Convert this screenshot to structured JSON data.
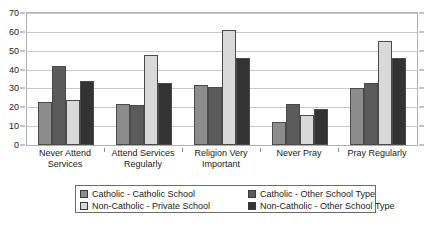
{
  "chart_data": {
    "type": "bar",
    "title": "",
    "xlabel": "",
    "ylabel": "",
    "ylim": [
      0,
      70
    ],
    "ytick_step": 10,
    "yticks": [
      0,
      10,
      20,
      30,
      40,
      50,
      60,
      70
    ],
    "grid": true,
    "legend_position": "bottom",
    "categories": [
      "Never Attend Services",
      "Attend Services Regularly",
      "Religion Very Important",
      "Never Pray",
      "Pray Regularly"
    ],
    "category_lines": [
      [
        "Never Attend",
        "Services"
      ],
      [
        "Attend Services",
        "Regularly"
      ],
      [
        "Religion Very",
        "Important"
      ],
      [
        "Never Pray",
        ""
      ],
      [
        "Pray Regularly",
        ""
      ]
    ],
    "series": [
      {
        "name": "Catholic - Catholic School",
        "color": "#8c8c8c",
        "values": [
          23,
          22,
          32,
          12,
          30
        ]
      },
      {
        "name": "Catholic - Other School Type",
        "color": "#5b5b5b",
        "values": [
          42,
          21,
          31,
          22,
          33
        ]
      },
      {
        "name": "Non-Catholic - Private School",
        "color": "#d9d9d9",
        "values": [
          24,
          48,
          61,
          16,
          55
        ]
      },
      {
        "name": "Non-Catholic - Other School Type",
        "color": "#333333",
        "values": [
          34,
          33,
          46,
          19,
          46
        ]
      }
    ]
  },
  "legend": {
    "items": [
      "Catholic - Catholic School",
      "Catholic - Other School Type",
      "Non-Catholic - Private School",
      "Non-Catholic - Other School Type"
    ]
  },
  "colors": {
    "series_1": "#8c8c8c",
    "series_2": "#5b5b5b",
    "series_3": "#d9d9d9",
    "series_4": "#333333",
    "grid": "#c9c9c9",
    "frame": "#b0b0b0",
    "text": "#1a1a1a"
  }
}
